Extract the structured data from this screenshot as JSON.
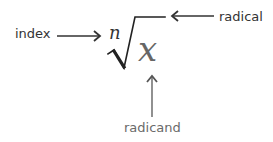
{
  "diagram": {
    "labels": {
      "index": "index",
      "radical": "radical",
      "radicand": "radicand"
    },
    "expression": {
      "index_symbol": "n",
      "radicand_symbol": "x"
    },
    "colors": {
      "label_dark": "#333333",
      "label_light": "#6a6a6a",
      "radicand_symbol": "#666666"
    }
  }
}
